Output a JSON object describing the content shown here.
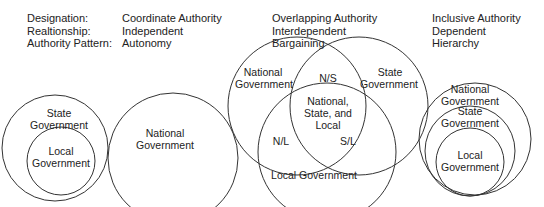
{
  "header": {
    "labels": {
      "designation": "Designation:",
      "relationship": "Realtionship:",
      "authority_pattern": "Authority Pattern:"
    },
    "models": [
      {
        "designation": "Coordinate Authority",
        "relationship": "Independent",
        "authority_pattern": "Autonomy"
      },
      {
        "designation": "Overlapping Authority",
        "relationship": "Interdependent",
        "authority_pattern": "Bargaining"
      },
      {
        "designation": "Inclusive Authority",
        "relationship": "Dependent",
        "authority_pattern": "Hierarchy"
      }
    ]
  },
  "coordinate": {
    "state_line1": "State",
    "state_line2": "Government",
    "local_line1": "Local",
    "local_line2": "Government",
    "national_line1": "National",
    "national_line2": "Government"
  },
  "overlapping": {
    "national_line1": "National",
    "national_line2": "Government",
    "state_line1": "State",
    "state_line2": "Government",
    "ns": "N/S",
    "center_line1": "National,",
    "center_line2": "State, and",
    "center_line3": "Local",
    "nl": "N/L",
    "sl": "S/L",
    "local": "Local Government"
  },
  "inclusive": {
    "national_line1": "National",
    "national_line2": "Government",
    "state_line1": "State",
    "state_line2": "Government",
    "local_line1": "Local",
    "local_line2": "Government"
  }
}
